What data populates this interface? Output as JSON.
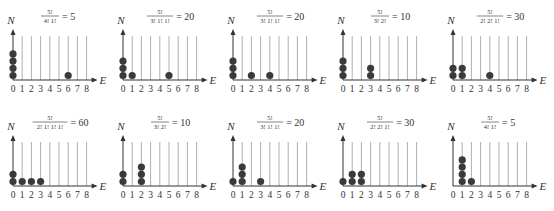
{
  "chart_data": {
    "type": "diagram",
    "axis_labels": {
      "x": "E",
      "y": "N"
    },
    "x_ticks": [
      "0",
      "1",
      "2",
      "3",
      "4",
      "5",
      "6",
      "7",
      "8"
    ],
    "panels": [
      {
        "numerator": "5!",
        "denominator": "4! 1!",
        "value": "5",
        "occupancy": {
          "0": 4,
          "6": 1
        }
      },
      {
        "numerator": "5!",
        "denominator": "3! 1! 1!",
        "value": "20",
        "occupancy": {
          "0": 3,
          "1": 1,
          "5": 1
        }
      },
      {
        "numerator": "5!",
        "denominator": "3! 1! 1!",
        "value": "20",
        "occupancy": {
          "0": 3,
          "2": 1,
          "4": 1
        }
      },
      {
        "numerator": "5!",
        "denominator": "3! 2!",
        "value": "10",
        "occupancy": {
          "0": 3,
          "3": 2
        }
      },
      {
        "numerator": "5!",
        "denominator": "2! 2! 1!",
        "value": "30",
        "occupancy": {
          "0": 2,
          "1": 2,
          "4": 1
        }
      },
      {
        "numerator": "5!",
        "denominator": "2! 1! 1! 1!",
        "value": "60",
        "occupancy": {
          "0": 2,
          "1": 1,
          "2": 1,
          "3": 1
        }
      },
      {
        "numerator": "5!",
        "denominator": "3! 2!",
        "value": "10",
        "occupancy": {
          "0": 2,
          "2": 3
        }
      },
      {
        "numerator": "5!",
        "denominator": "3! 1! 1!",
        "value": "20",
        "occupancy": {
          "0": 1,
          "1": 3,
          "3": 1
        }
      },
      {
        "numerator": "5!",
        "denominator": "2! 2! 1!",
        "value": "30",
        "occupancy": {
          "0": 1,
          "1": 2,
          "2": 2
        }
      },
      {
        "numerator": "5!",
        "denominator": "4! 1!",
        "value": "5",
        "occupancy": {
          "1": 4,
          "2": 1
        }
      }
    ]
  },
  "colors": {
    "ball": "#3a3a3a",
    "axis": "#333333",
    "gridline": "#9a9a9a",
    "text": "#333333"
  }
}
